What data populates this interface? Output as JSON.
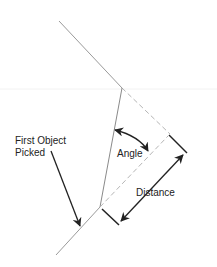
{
  "diagram": {
    "type": "geometry-annotation",
    "labels": {
      "first_object_line1": "First Object",
      "first_object_line2": "Picked",
      "angle": "Angle",
      "distance": "Distance"
    },
    "colors": {
      "line": "#9a9a9a",
      "dashed": "#b5b5b5",
      "arrow": "#222222",
      "text": "#222222",
      "background": "#ffffff"
    }
  }
}
